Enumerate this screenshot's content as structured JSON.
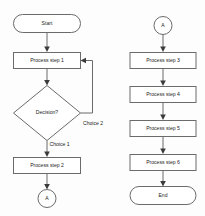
{
  "diagram": {
    "type": "flowchart",
    "title": "",
    "columns": [
      {
        "name": "left-column",
        "nodes": [
          {
            "id": "start",
            "shape": "terminator",
            "label": "Start"
          },
          {
            "id": "step1",
            "shape": "process",
            "label": "Process step 1"
          },
          {
            "id": "decision",
            "shape": "decision",
            "label": "Decision?"
          },
          {
            "id": "step2",
            "shape": "process",
            "label": "Process step 2"
          },
          {
            "id": "conn-a-out",
            "shape": "connector",
            "label": "A"
          }
        ]
      },
      {
        "name": "right-column",
        "nodes": [
          {
            "id": "conn-a-in",
            "shape": "connector",
            "label": "A"
          },
          {
            "id": "step3",
            "shape": "process",
            "label": "Process step 3"
          },
          {
            "id": "step4",
            "shape": "process",
            "label": "Process step 4"
          },
          {
            "id": "step5",
            "shape": "process",
            "label": "Process step 5"
          },
          {
            "id": "step6",
            "shape": "process",
            "label": "Process step 6"
          },
          {
            "id": "end",
            "shape": "terminator",
            "label": "End"
          }
        ]
      }
    ],
    "edge_labels": {
      "choice1": "Choice 1",
      "choice2": "Choice 2"
    },
    "colors": {
      "stroke": "#6b6b6b",
      "fill": "#ffffff",
      "text": "#1a1a1a",
      "arrow": "#3a3a3a",
      "background": "#fdfdfd"
    }
  }
}
